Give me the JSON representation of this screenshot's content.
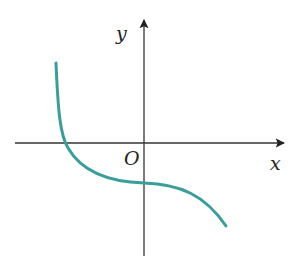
{
  "diagram": {
    "type": "function-graph",
    "axes": {
      "x_label": "x",
      "y_label": "y",
      "origin_label": "O",
      "color": "#333333"
    },
    "curve": {
      "color": "#3a9e9a",
      "description": "decreasing function crossing negative x-axis and negative y-axis",
      "path": "M56,63 C58,110 60,135 68,148 C82,172 110,182 144,183 C180,184 205,195 226,226"
    }
  }
}
